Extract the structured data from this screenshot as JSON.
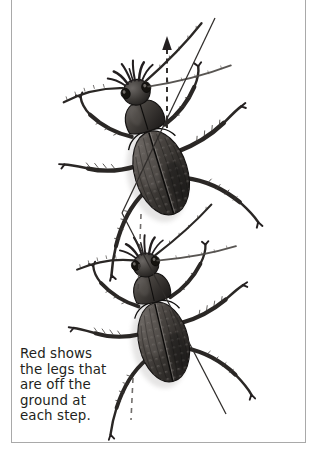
{
  "figure": {
    "kind": "scientific-illustration",
    "background_color": "#ffffff",
    "border_color": "#a9a9a9",
    "ink_color": "#231f20",
    "caption": "Red shows\nthe legs that\nare off the\nground at\neach step.",
    "caption_lines": [
      "Red shows",
      "the legs that",
      "are off the",
      "ground at",
      "each step."
    ],
    "direction_arrow": {
      "label": "direction of travel",
      "style": "dashed",
      "orientation": "vertical",
      "arrowhead": "up"
    },
    "body_axis_line": {
      "label": "body axis / trajectory line",
      "style": "solid",
      "orientation": "diagonal"
    },
    "specimens": [
      {
        "name": "beetle-upper",
        "step": "step 1"
      },
      {
        "name": "beetle-lower",
        "step": "step 2"
      }
    ]
  }
}
